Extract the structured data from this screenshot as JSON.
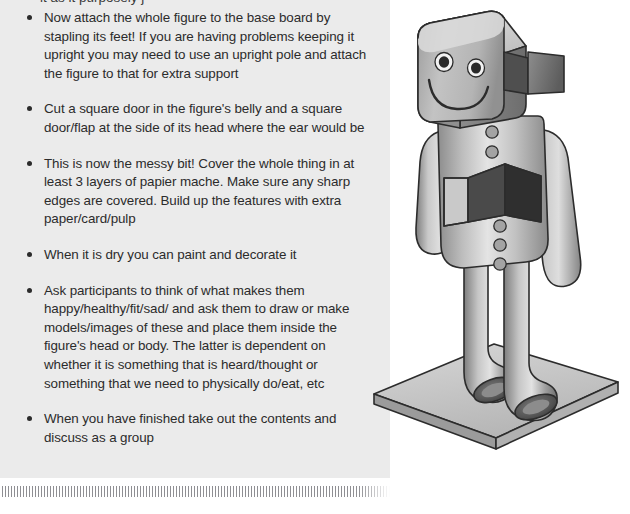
{
  "document": {
    "panel_bg": "#ebebeb",
    "text_color": "#2b2b2b",
    "clipped_top_line": "it as it purposely j"
  },
  "instructions": {
    "bullets": [
      "Now attach the whole figure to the base board by stapling its feet! If you are having problems keeping it upright you may need to  use an upright pole and attach the figure to that for extra support",
      "Cut a square door in the figure's belly and a square door/flap at the side of its head where the ear would be",
      "This is now the messy bit! Cover the whole thing in at least 3 layers of papier mache. Make sure any sharp edges are covered. Build up the features with extra paper/card/pulp",
      "When it is dry you can paint and decorate it",
      "Ask participants to think of what makes them happy/healthy/fit/sad/ and ask them to draw or make models/images of these and place them inside the figure's head or body. The latter is dependent on whether it is something that is heard/thought or something that we need to physically do/eat, etc",
      "When you have finished take out the contents and discuss as a group"
    ]
  },
  "illustration": {
    "title": "papier mache robot figure on base board",
    "colors": {
      "outline": "#2c2c2c",
      "light": "#d8d8d8",
      "mid": "#a8a8a8",
      "dark": "#6e6e6e",
      "shadow": "#4a4a4a",
      "cavity": "#3f3f3f",
      "board_top": "#c9c9c9",
      "board_edge": "#8e8e8e"
    },
    "parts": [
      "head",
      "ear-flap-door",
      "eye-left",
      "eye-right",
      "mouth-smile",
      "torso",
      "belly-door",
      "buttons",
      "arm-left",
      "arm-right",
      "leg-left",
      "leg-right",
      "foot-left",
      "foot-right",
      "base-board"
    ],
    "button_count": 5
  }
}
